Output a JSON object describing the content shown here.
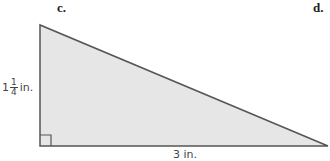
{
  "problem_labels": {
    "left": "c.",
    "right": "d."
  },
  "figure": {
    "shape": "right-triangle",
    "fill_color": "#e6e6e6",
    "stroke_color": "#555555",
    "vertices": {
      "top": [
        40,
        25
      ],
      "right_angle": [
        40,
        146
      ],
      "right": [
        328,
        146
      ]
    },
    "height_label": {
      "whole": "1",
      "numerator": "1",
      "denominator": "4",
      "unit": "in."
    },
    "base_label": "3 in."
  }
}
